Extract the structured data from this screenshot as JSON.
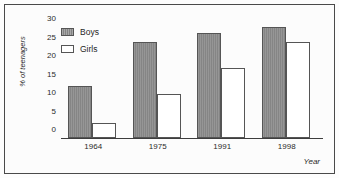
{
  "chart_data": {
    "type": "bar",
    "title": "",
    "xlabel": "Year",
    "ylabel": "% of teenagers",
    "categories": [
      "1964",
      "1975",
      "1991",
      "1998"
    ],
    "series": [
      {
        "name": "Boys",
        "color": "#8a8a8a",
        "values": [
          14,
          26,
          28.5,
          30
        ]
      },
      {
        "name": "Girls",
        "color": "#ffffff",
        "values": [
          4,
          12,
          19,
          26
        ]
      }
    ],
    "ylim": [
      0,
      30
    ],
    "yticks": [
      "0",
      "5",
      "10",
      "15",
      "20",
      "25",
      "30"
    ],
    "ytick_values": [
      0,
      5,
      10,
      15,
      20,
      25,
      30
    ],
    "grid": false,
    "legend_position": "top-left"
  },
  "legend": {
    "items": [
      {
        "label": "Boys"
      },
      {
        "label": "Girls"
      }
    ]
  },
  "axes": {
    "y_title": "% of teenagers",
    "x_title": "Year"
  }
}
